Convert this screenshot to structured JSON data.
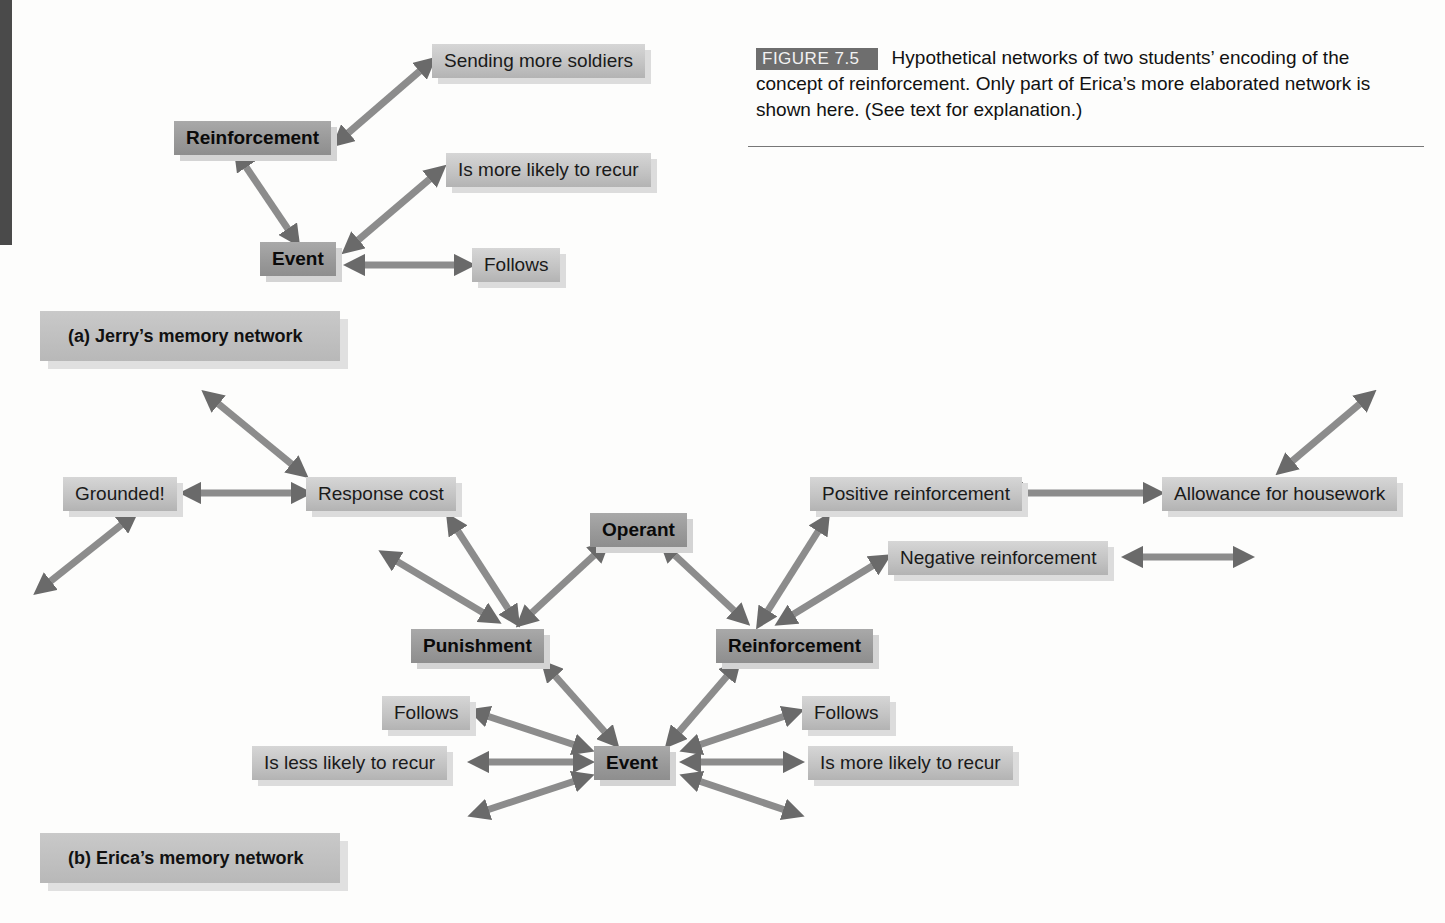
{
  "page": {
    "page_number": "302",
    "accent_bar_color": "#4a4a4a"
  },
  "figure": {
    "label": "FIGURE 7.5",
    "caption": "Hypothetical networks of two students’ encoding of the concept of reinforcement. Only part of Erica’s more elaborated network is shown here. (See text for explanation.)"
  },
  "network_a": {
    "title": "(a) Jerry’s memory network",
    "nodes": {
      "reinforcement": "Reinforcement",
      "event": "Event",
      "sending_more_soldiers": "Sending more soldiers",
      "is_more_likely": "Is more likely to recur",
      "follows": "Follows"
    }
  },
  "network_b": {
    "title": "(b) Erica’s memory network",
    "nodes": {
      "grounded": "Grounded!",
      "response_cost": "Response cost",
      "operant": "Operant",
      "punishment": "Punishment",
      "reinforcement": "Reinforcement",
      "positive_reinforcement": "Positive reinforcement",
      "negative_reinforcement": "Negative reinforcement",
      "allowance": "Allowance for housework",
      "follows_left": "Follows",
      "follows_right": "Follows",
      "is_less_likely": "Is less likely to recur",
      "event": "Event",
      "is_more_likely": "Is more likely to recur"
    }
  },
  "colors": {
    "arrow_dark": "#6b6b6b",
    "arrow_light": "#a8a8a8",
    "bold_node": "#999999",
    "plain_node": "#c4c4c4"
  }
}
